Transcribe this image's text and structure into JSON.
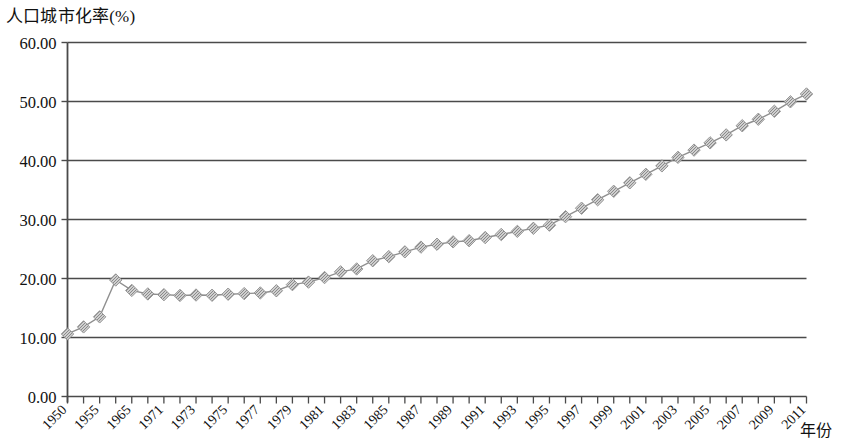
{
  "chart_data": {
    "type": "line",
    "title": "人口城市化率(%)",
    "xlabel": "年份",
    "ylabel": "人口城市化率(%)",
    "ylim": [
      0,
      60
    ],
    "ytick_labels": [
      "0.00",
      "10.00",
      "20.00",
      "30.00",
      "40.00",
      "50.00",
      "60.00"
    ],
    "ytick_values": [
      0,
      10,
      20,
      30,
      40,
      50,
      60
    ],
    "grid": true,
    "legend": "none",
    "marker": "diamond",
    "marker_color": "#8f8f8f",
    "line_color": "#8f8f8f",
    "xtick_labels": [
      "1950",
      "1955",
      "1965",
      "1971",
      "1973",
      "1975",
      "1977",
      "1979",
      "1981",
      "1983",
      "1985",
      "1987",
      "1989",
      "1991",
      "1993",
      "1995",
      "1997",
      "1999",
      "2001",
      "2003",
      "2005",
      "2007",
      "2009",
      "2011"
    ],
    "xtick_label_indices": [
      0,
      2,
      4,
      6,
      8,
      10,
      12,
      14,
      16,
      18,
      20,
      22,
      24,
      26,
      28,
      30,
      32,
      34,
      36,
      38,
      40,
      42,
      44,
      46
    ],
    "categories": [
      "1950",
      "1952",
      "1955",
      "1960",
      "1965",
      "1970",
      "1971",
      "1972",
      "1973",
      "1974",
      "1975",
      "1976",
      "1977",
      "1978",
      "1979",
      "1980",
      "1981",
      "1982",
      "1983",
      "1984",
      "1985",
      "1986",
      "1987",
      "1988",
      "1989",
      "1990",
      "1991",
      "1992",
      "1993",
      "1994",
      "1995",
      "1996",
      "1997",
      "1998",
      "1999",
      "2000",
      "2001",
      "2002",
      "2003",
      "2004",
      "2005",
      "2006",
      "2007",
      "2008",
      "2009",
      "2010",
      "2011"
    ],
    "values": [
      10.6,
      11.8,
      13.5,
      19.75,
      17.98,
      17.38,
      17.26,
      17.13,
      17.2,
      17.16,
      17.34,
      17.44,
      17.55,
      17.92,
      18.96,
      19.39,
      20.16,
      21.13,
      21.62,
      23.01,
      23.71,
      24.52,
      25.32,
      25.81,
      26.21,
      26.41,
      26.94,
      27.46,
      27.99,
      28.51,
      29.04,
      30.48,
      31.91,
      33.35,
      34.78,
      36.22,
      37.66,
      39.09,
      40.53,
      41.76,
      42.99,
      44.34,
      45.89,
      46.99,
      48.34,
      49.95,
      51.27
    ],
    "series": [
      {
        "name": "人口城市化率",
        "values": [
          10.6,
          11.8,
          13.5,
          19.75,
          17.98,
          17.38,
          17.26,
          17.13,
          17.2,
          17.16,
          17.34,
          17.44,
          17.55,
          17.92,
          18.96,
          19.39,
          20.16,
          21.13,
          21.62,
          23.01,
          23.71,
          24.52,
          25.32,
          25.81,
          26.21,
          26.41,
          26.94,
          27.46,
          27.99,
          28.51,
          29.04,
          30.48,
          31.91,
          33.35,
          34.78,
          36.22,
          37.66,
          39.09,
          40.53,
          41.76,
          42.99,
          44.34,
          45.89,
          46.99,
          48.34,
          49.95,
          51.27
        ]
      }
    ]
  },
  "axis": {
    "y_title": "人口城市化率(%)",
    "x_title": "年份"
  }
}
